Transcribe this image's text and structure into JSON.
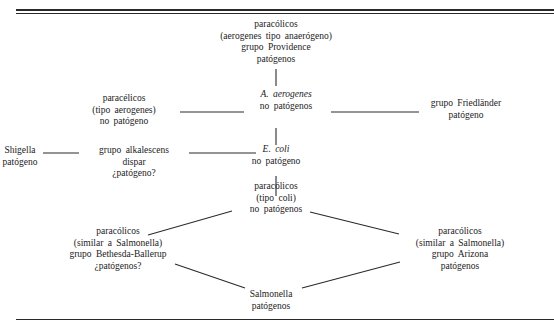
{
  "diagram": {
    "type": "relationship-diagram",
    "nodes": [
      {
        "id": "top",
        "lines": [
          "paracólicos",
          "(aerogenes tipo anaerógeno)",
          "grupo Providence",
          "patógenos"
        ]
      },
      {
        "id": "aerogenes",
        "lines": [
          "A. aerogenes",
          "no patógenos"
        ],
        "italic_first_line": true
      },
      {
        "id": "tipo-aerogenes",
        "lines": [
          "paracélicos",
          "(tipo aerogenes)",
          "no patógeno"
        ]
      },
      {
        "id": "friedlander",
        "lines": [
          "grupo Friedländer",
          "patógeno"
        ]
      },
      {
        "id": "shigella",
        "lines": [
          "Shigella",
          "patógeno"
        ]
      },
      {
        "id": "alkalescens",
        "lines": [
          "grupo alkalescens",
          "dispar",
          "¿patógeno?"
        ]
      },
      {
        "id": "coli",
        "lines": [
          "E. coli",
          "no patógeno"
        ],
        "italic_first_line": true
      },
      {
        "id": "tipo-coli",
        "lines": [
          "paracólicos",
          "(tipo coli)",
          "no patógenos"
        ]
      },
      {
        "id": "bethesda",
        "lines": [
          "paracólicos",
          "(similar a Salmonella)",
          "grupo Bethesda-Ballerup",
          "¿patógenos?"
        ]
      },
      {
        "id": "arizona",
        "lines": [
          "paracólicos",
          "(similar a Salmonella)",
          "grupo Arizona",
          "patógenos"
        ]
      },
      {
        "id": "salmonella",
        "lines": [
          "Salmonella",
          "patógenos"
        ]
      }
    ],
    "edges": [
      [
        "top",
        "aerogenes"
      ],
      [
        "tipo-aerogenes",
        "aerogenes"
      ],
      [
        "aerogenes",
        "friedlander"
      ],
      [
        "aerogenes",
        "coli"
      ],
      [
        "shigella",
        "alkalescens"
      ],
      [
        "alkalescens",
        "coli"
      ],
      [
        "coli",
        "tipo-coli"
      ],
      [
        "tipo-coli",
        "bethesda"
      ],
      [
        "tipo-coli",
        "arizona"
      ],
      [
        "bethesda",
        "salmonella"
      ],
      [
        "arizona",
        "salmonella"
      ]
    ]
  }
}
